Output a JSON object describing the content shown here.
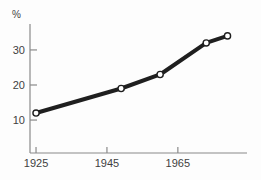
{
  "chart_data": {
    "type": "line",
    "title": "",
    "xlabel": "",
    "ylabel": "%",
    "x": [
      1925,
      1949,
      1960,
      1973,
      1979
    ],
    "values": [
      12,
      19,
      23,
      32,
      34
    ],
    "x_ticks": [
      "1925",
      "1945",
      "1965"
    ],
    "x_tick_years": [
      1925,
      1945,
      1965
    ],
    "y_ticks": [
      "10",
      "20",
      "30"
    ],
    "y_tick_values": [
      10,
      20,
      30
    ],
    "xlim": [
      1923.3,
      1984.5
    ],
    "ylim": [
      0.6,
      37.4
    ],
    "grid": false,
    "legend": false,
    "marker": "open-circle",
    "colors": {
      "line": "#1f1f1f",
      "marker_fill": "#ffffff",
      "axis": "#8a8a8a",
      "text": "#3f3f3f",
      "background": "#fdfdfd"
    }
  }
}
